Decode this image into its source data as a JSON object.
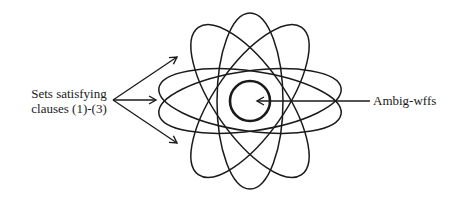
{
  "diagram": {
    "left_label_line1": "Sets satisfying",
    "left_label_line2": "clauses (1)-(3)",
    "right_label": "Ambig-wffs",
    "stroke_color": "#1a1a1a",
    "center": [
      250,
      101
    ],
    "ellipses": [
      {
        "rx": 92,
        "ry": 34,
        "angle": 0,
        "dy": -4
      },
      {
        "rx": 92,
        "ry": 34,
        "angle": 0,
        "dy": 4
      },
      {
        "rx": 88,
        "ry": 36,
        "angle": 60
      },
      {
        "rx": 88,
        "ry": 36,
        "angle": -60
      },
      {
        "rx": 88,
        "ry": 36,
        "angle": 90
      },
      {
        "rx": 88,
        "ry": 36,
        "angle": 30
      },
      {
        "rx": 88,
        "ry": 36,
        "angle": -30
      }
    ],
    "inner_circle_radius": 20
  }
}
